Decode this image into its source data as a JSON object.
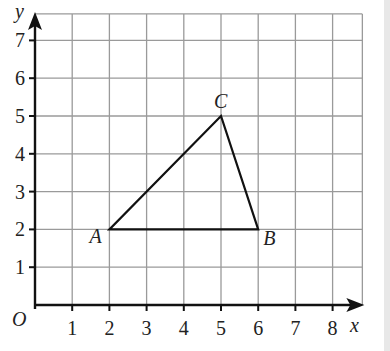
{
  "diagram": {
    "type": "coordinate-grid-triangle",
    "axes": {
      "x_label": "x",
      "y_label": "y",
      "origin_label": "O",
      "x_ticks": [
        "1",
        "2",
        "3",
        "4",
        "5",
        "6",
        "7",
        "8"
      ],
      "y_ticks": [
        "1",
        "2",
        "3",
        "4",
        "5",
        "6",
        "7"
      ]
    },
    "grid": {
      "x_min": 0,
      "x_max": 8.8,
      "y_min": 0,
      "y_max": 7.7,
      "line_color": "#9a9a9a",
      "axis_color": "#111111"
    },
    "points": [
      {
        "label": "A",
        "x": 2,
        "y": 2
      },
      {
        "label": "B",
        "x": 6,
        "y": 2
      },
      {
        "label": "C",
        "x": 5,
        "y": 5
      }
    ],
    "triangle": [
      "A",
      "B",
      "C"
    ]
  }
}
